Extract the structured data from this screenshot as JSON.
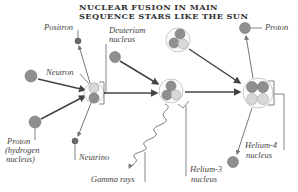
{
  "title": {
    "line1": "NUCLEAR FUSION IN MAIN",
    "line2": "SEQUENCE STARS LIKE THE SUN"
  },
  "labels": {
    "positron": "Positron",
    "neutron": "Neutron",
    "proton_hydrogen_1": "Proton",
    "proton_hydrogen_2": "(hydrogen",
    "proton_hydrogen_3": "nucleus)",
    "neutrino": "Neutrino",
    "deuterium_1": "Deuterium",
    "deuterium_2": "nucleus",
    "gamma_rays": "Gamma rays",
    "helium3_1": "Helium-3",
    "helium3_2": "nucleus",
    "helium4_1": "Helium-4",
    "helium4_2": "nucleus",
    "proton_out": "Proton"
  },
  "colors": {
    "proton": "#8f8f8f",
    "neutron": "#d8d8d8",
    "arrow": "#444444",
    "text": "#444444"
  }
}
